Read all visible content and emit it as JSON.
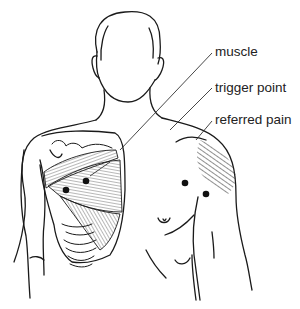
{
  "diagram": {
    "labels": [
      {
        "text": "muscle"
      },
      {
        "text": "trigger point"
      },
      {
        "text": "referred pain"
      }
    ],
    "colors": {
      "stroke": "#1a1a1a",
      "background": "#ffffff"
    }
  }
}
